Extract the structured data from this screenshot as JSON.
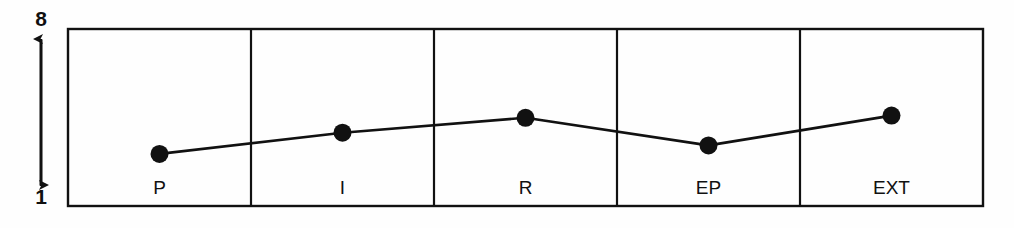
{
  "chart_data": {
    "type": "line",
    "title": "",
    "subtitle": "",
    "xlabel": "",
    "ylabel": "",
    "categories": [
      "P",
      "I",
      "R",
      "EP",
      "EXT"
    ],
    "values": [
      2.6,
      3.6,
      4.3,
      3.0,
      4.4
    ],
    "series": [
      {
        "name": "",
        "values": [
          2.6,
          3.6,
          4.3,
          3.0,
          4.4
        ]
      }
    ],
    "ylim": [
      1,
      8
    ],
    "y_axis_ticks": [
      "1",
      "8"
    ],
    "y_axis_top_label": "8",
    "y_axis_bottom_label": "1",
    "grid": false,
    "legend": "none",
    "marker": "filled-circle",
    "line_color": "#111111",
    "marker_color": "#111111",
    "frame_color": "#111111",
    "background_color": "#fefefe",
    "annotations": []
  },
  "axis": {
    "top_value": "8",
    "bottom_value": "1"
  },
  "categories": [
    {
      "label": "P"
    },
    {
      "label": "I"
    },
    {
      "label": "R"
    },
    {
      "label": "EP"
    },
    {
      "label": "EXT"
    }
  ]
}
